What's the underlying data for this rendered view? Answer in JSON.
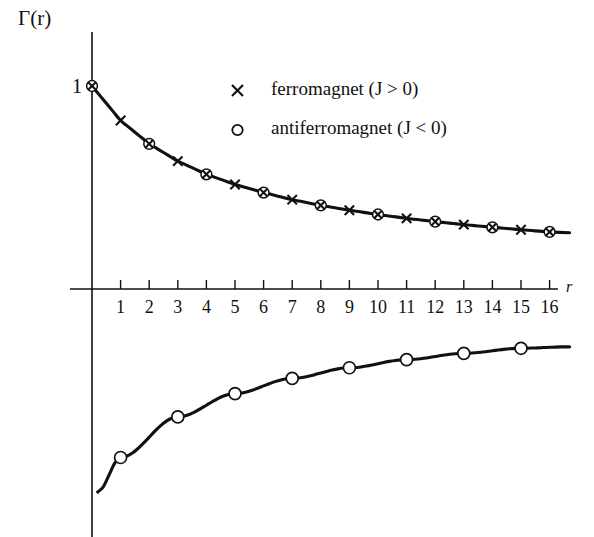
{
  "chart_data": {
    "type": "line",
    "title": "",
    "subtitle": "",
    "xlabel": "r",
    "ylabel": "Γ(r)",
    "xlim": [
      -0.35,
      16.9
    ],
    "ylim": [
      -1.05,
      1.15
    ],
    "grid": false,
    "legend_position": "upper-right-inside",
    "x": [
      0,
      1,
      2,
      3,
      4,
      5,
      6,
      7,
      8,
      9,
      10,
      11,
      12,
      13,
      14,
      15,
      16
    ],
    "xticks": [
      "1",
      "2",
      "3",
      "4",
      "5",
      "6",
      "7",
      "8",
      "9",
      "10",
      "11",
      "12",
      "13",
      "14",
      "15",
      "16"
    ],
    "ytick_labels": [
      "1"
    ],
    "ytick_values": [
      1
    ],
    "series": [
      {
        "name": "ferromagnet (J > 0)",
        "marker": "x",
        "marker_name": "cross-marker",
        "values": [
          1.0,
          0.83,
          0.715,
          0.63,
          0.565,
          0.515,
          0.475,
          0.44,
          0.412,
          0.388,
          0.367,
          0.348,
          0.332,
          0.317,
          0.304,
          0.292,
          0.281
        ]
      },
      {
        "name": "antiferromagnet (J < 0)",
        "marker": "o",
        "marker_name": "circle-marker",
        "values": [
          1.0,
          -0.83,
          0.715,
          -0.63,
          0.565,
          -0.515,
          0.475,
          -0.44,
          0.412,
          -0.388,
          0.367,
          -0.348,
          0.332,
          -0.317,
          0.304,
          -0.292,
          0.281
        ]
      }
    ],
    "lower_branch": {
      "description": "antiferromagnet odd-r branch plotted as negative values",
      "x": [
        0.2,
        1,
        3,
        5,
        7,
        9,
        11,
        13,
        15,
        16.6
      ],
      "values": [
        -1.0,
        -0.83,
        -0.63,
        -0.515,
        -0.44,
        -0.388,
        -0.348,
        -0.317,
        -0.292,
        -0.285
      ]
    },
    "annotations": []
  },
  "legend": {
    "entries": [
      {
        "marker": "×",
        "marker_name": "cross-marker",
        "label": "ferromagnet (J > 0)"
      },
      {
        "marker": "○",
        "marker_name": "circle-marker",
        "label": "antiferromagnet (J < 0)"
      }
    ]
  },
  "axes": {
    "y_axis_label": "Γ(r)",
    "x_axis_label": "r",
    "y_one_label": "1",
    "x_tick_labels": [
      "1",
      "2",
      "3",
      "4",
      "5",
      "6",
      "7",
      "8",
      "9",
      "10",
      "11",
      "12",
      "13",
      "14",
      "15",
      "16"
    ]
  }
}
